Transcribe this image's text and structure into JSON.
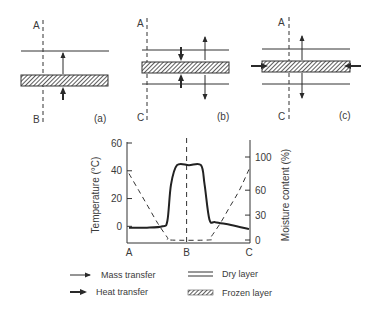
{
  "panels": [
    {
      "id": "a",
      "label": "(a)",
      "top_letter": "A",
      "bottom_letter": "B",
      "description": "Frozen layer at bottom, dry layer above; heat transfer from bottom and top, mass transfer upward"
    },
    {
      "id": "b",
      "label": "(b)",
      "top_letter": "A",
      "bottom_letter": "C",
      "description": "Frozen layer between two dry layers; heat transfer from both sides, mass transfer both directions"
    },
    {
      "id": "c",
      "label": "(c)",
      "top_letter": "A",
      "bottom_letter": "C",
      "description": "Frozen layer between dry layers; heat transfer through frozen layer ends, mass transfer both directions"
    }
  ],
  "chart_data": {
    "type": "line",
    "title": "",
    "xlabel": "",
    "x_ticks": [
      "A",
      "B",
      "C"
    ],
    "ylabel_left": "Temperature (°C)",
    "ylabel_right": "Moisture content (%)",
    "y_left_ticks": [
      0,
      20,
      40,
      60
    ],
    "y_right_ticks": [
      0,
      30,
      60,
      100
    ],
    "ylim_left": [
      -12,
      60
    ],
    "ylim_right": [
      0,
      100
    ],
    "grid": false,
    "series": [
      {
        "name": "Temperature",
        "axis": "left",
        "style": "solid",
        "x": [
          0.0,
          0.15,
          0.28,
          0.32,
          0.35,
          0.4,
          0.5,
          0.6,
          0.63,
          0.67,
          0.72,
          0.85,
          1.0
        ],
        "y": [
          -1,
          -1,
          0,
          4,
          30,
          44,
          44,
          44,
          30,
          5,
          3,
          1,
          -2
        ]
      },
      {
        "name": "Moisture content",
        "axis": "right",
        "style": "dashed",
        "x": [
          0.0,
          0.08,
          0.16,
          0.24,
          0.32,
          0.34,
          0.66,
          0.68,
          0.76,
          0.84,
          0.92,
          1.0
        ],
        "y": [
          80,
          60,
          40,
          20,
          3,
          0,
          0,
          3,
          20,
          40,
          60,
          85
        ]
      }
    ],
    "vertical_marker": {
      "x_label": "B",
      "style": "dashed"
    }
  },
  "legend": {
    "items": [
      {
        "symbol": "thin-arrow",
        "label": "Mass transfer"
      },
      {
        "symbol": "bold-arrow",
        "label": "Heat transfer"
      },
      {
        "symbol": "double-line",
        "label": "Dry layer"
      },
      {
        "symbol": "hatched",
        "label": "Frozen layer"
      }
    ]
  },
  "colors": {
    "ink": "#2a2a2a",
    "text": "#3a3a3a"
  }
}
